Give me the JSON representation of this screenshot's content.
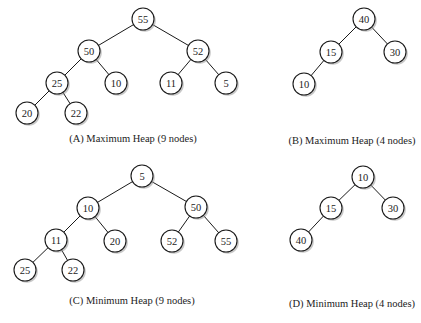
{
  "figure": {
    "node_radius": 11,
    "colors": {
      "edge": "#1a1a1a",
      "node_fill": "#ffffff",
      "node_stroke": "#1a1a1a",
      "shadow": "#9a9a9a",
      "text": "#222222"
    },
    "diagrams": [
      {
        "id": "A",
        "caption": "(A) Maximum Heap (9 nodes)",
        "caption_pos": [
          133,
          133
        ],
        "nodes": [
          {
            "v": "55",
            "x": 143,
            "y": 19
          },
          {
            "v": "50",
            "x": 89,
            "y": 51
          },
          {
            "v": "52",
            "x": 198,
            "y": 51
          },
          {
            "v": "25",
            "x": 57,
            "y": 83
          },
          {
            "v": "10",
            "x": 116,
            "y": 83
          },
          {
            "v": "11",
            "x": 171,
            "y": 83
          },
          {
            "v": "5",
            "x": 226,
            "y": 83
          },
          {
            "v": "20",
            "x": 27,
            "y": 113
          },
          {
            "v": "22",
            "x": 76,
            "y": 113
          }
        ],
        "edges": [
          [
            0,
            1
          ],
          [
            0,
            2
          ],
          [
            1,
            3
          ],
          [
            1,
            4
          ],
          [
            2,
            5
          ],
          [
            2,
            6
          ],
          [
            3,
            7
          ],
          [
            3,
            8
          ]
        ]
      },
      {
        "id": "B",
        "caption": "(B) Maximum Heap (4 nodes)",
        "caption_pos": [
          352,
          135
        ],
        "nodes": [
          {
            "v": "40",
            "x": 364,
            "y": 19
          },
          {
            "v": "15",
            "x": 331,
            "y": 52
          },
          {
            "v": "30",
            "x": 395,
            "y": 52
          },
          {
            "v": "10",
            "x": 304,
            "y": 84
          }
        ],
        "edges": [
          [
            0,
            1
          ],
          [
            0,
            2
          ],
          [
            1,
            3
          ]
        ]
      },
      {
        "id": "C",
        "caption": "(C) Minimum Heap (9 nodes)",
        "caption_pos": [
          132,
          295
        ],
        "nodes": [
          {
            "v": "5",
            "x": 142,
            "y": 176
          },
          {
            "v": "10",
            "x": 88,
            "y": 208
          },
          {
            "v": "50",
            "x": 196,
            "y": 207
          },
          {
            "v": "11",
            "x": 56,
            "y": 240
          },
          {
            "v": "20",
            "x": 115,
            "y": 241
          },
          {
            "v": "52",
            "x": 172,
            "y": 241
          },
          {
            "v": "55",
            "x": 226,
            "y": 241
          },
          {
            "v": "25",
            "x": 25,
            "y": 270
          },
          {
            "v": "22",
            "x": 73,
            "y": 270
          }
        ],
        "edges": [
          [
            0,
            1
          ],
          [
            0,
            2
          ],
          [
            1,
            3
          ],
          [
            1,
            4
          ],
          [
            2,
            5
          ],
          [
            2,
            6
          ],
          [
            3,
            7
          ],
          [
            3,
            8
          ]
        ]
      },
      {
        "id": "D",
        "caption": "(D) Minimum Heap (4 nodes)",
        "caption_pos": [
          352,
          298
        ],
        "nodes": [
          {
            "v": "10",
            "x": 363,
            "y": 177
          },
          {
            "v": "15",
            "x": 331,
            "y": 208
          },
          {
            "v": "30",
            "x": 393,
            "y": 208
          },
          {
            "v": "40",
            "x": 301,
            "y": 240
          }
        ],
        "edges": [
          [
            0,
            1
          ],
          [
            0,
            2
          ],
          [
            1,
            3
          ]
        ]
      }
    ]
  }
}
